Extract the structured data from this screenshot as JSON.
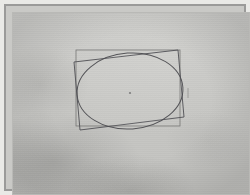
{
  "document": {
    "title": "Geometric construction drawing",
    "medium": "pencil on gray paper, photographed",
    "plate_border_color": "#9a9a99",
    "paper_color": "#c9c9c6",
    "ink_color": "#4e4e52",
    "outer_margin_color": "#e9e9e6"
  },
  "figure": {
    "caption": "",
    "label": "",
    "elements": [
      {
        "name": "axis-aligned-rectangle",
        "kind": "rectangle",
        "rotation_deg": 0
      },
      {
        "name": "tilted-rectangle",
        "kind": "rectangle",
        "rotation_deg": -6
      },
      {
        "name": "inscribed-ellipse",
        "kind": "ellipse",
        "rotation_deg": -4
      },
      {
        "name": "center-point",
        "kind": "point"
      },
      {
        "name": "right-edge-tick",
        "kind": "tick"
      }
    ]
  },
  "chart_data": {
    "type": "scatter",
    "title": "",
    "xlabel": "",
    "ylabel": "",
    "grid": false,
    "legend": "none",
    "xlim": [
      0,
      238
    ],
    "ylim": [
      0,
      183
    ],
    "annotations": [
      {
        "name": "center-point",
        "x": 118,
        "y": 81,
        "label": ""
      }
    ],
    "shapes": [
      {
        "name": "axis-aligned-rectangle",
        "type": "rect",
        "x": 64,
        "y": 38,
        "width": 104,
        "height": 76,
        "rotation_deg": 0,
        "stroke": "#6f6f6e"
      },
      {
        "name": "tilted-rectangle",
        "type": "polygon",
        "points": [
          [
            62,
            50
          ],
          [
            166,
            38
          ],
          [
            172,
            105
          ],
          [
            68,
            118
          ]
        ],
        "stroke": "#55555a"
      },
      {
        "name": "inscribed-ellipse",
        "type": "ellipse",
        "cx": 118,
        "cy": 79,
        "rx": 53,
        "ry": 38,
        "rotation_deg": -4,
        "stroke": "#4e4e52"
      },
      {
        "name": "right-edge-tick",
        "type": "line",
        "points": [
          [
            176,
            76
          ],
          [
            176,
            86
          ]
        ],
        "stroke": "#8a8a88"
      }
    ]
  }
}
